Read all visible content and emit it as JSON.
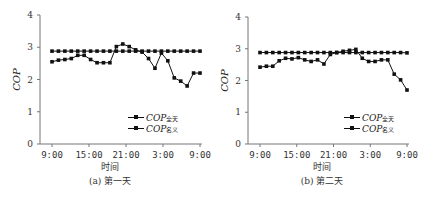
{
  "chart_data": [
    {
      "type": "line",
      "title": "",
      "caption": "(a) 第一天",
      "xlabel": "时间",
      "ylabel": "COP",
      "ylim": [
        0,
        4
      ],
      "yticks": [
        0,
        1,
        2,
        3,
        4
      ],
      "xtick_labels": [
        "9:00",
        "15:00",
        "21:00",
        "3:00",
        "9:00"
      ],
      "x": [
        "9:00",
        "10:00",
        "11:00",
        "12:00",
        "13:00",
        "14:00",
        "15:00",
        "16:00",
        "17:00",
        "18:00",
        "19:00",
        "20:00",
        "21:00",
        "22:00",
        "23:00",
        "0:00",
        "1:00",
        "2:00",
        "3:00",
        "4:00",
        "5:00",
        "6:00",
        "7:00",
        "8:00",
        "9:00"
      ],
      "grid": false,
      "legend_position": "lower right",
      "series": [
        {
          "name": "COP全天",
          "label_main": "COP",
          "label_sub": "全天",
          "values": [
            2.55,
            2.6,
            2.62,
            2.65,
            2.75,
            2.75,
            2.62,
            2.52,
            2.52,
            2.52,
            3.02,
            3.1,
            3.02,
            2.92,
            2.85,
            2.65,
            2.35,
            2.82,
            2.58,
            2.05,
            1.95,
            1.8,
            2.2,
            2.2
          ]
        },
        {
          "name": "COP名义",
          "label_main": "COP",
          "label_sub": "名义",
          "values": [
            2.88,
            2.88,
            2.88,
            2.88,
            2.88,
            2.88,
            2.88,
            2.88,
            2.88,
            2.88,
            2.88,
            2.88,
            2.88,
            2.88,
            2.88,
            2.88,
            2.88,
            2.88,
            2.88,
            2.88,
            2.88,
            2.88,
            2.88,
            2.88
          ]
        }
      ]
    },
    {
      "type": "line",
      "title": "",
      "caption": "(b) 第二天",
      "xlabel": "时间",
      "ylabel": "COP",
      "ylim": [
        0,
        4
      ],
      "yticks": [
        0,
        1,
        2,
        3,
        4
      ],
      "xtick_labels": [
        "9:00",
        "15:00",
        "21:00",
        "3:00",
        "9:00"
      ],
      "x": [
        "9:00",
        "10:00",
        "11:00",
        "12:00",
        "13:00",
        "14:00",
        "15:00",
        "16:00",
        "17:00",
        "18:00",
        "19:00",
        "20:00",
        "21:00",
        "22:00",
        "23:00",
        "0:00",
        "1:00",
        "2:00",
        "3:00",
        "4:00",
        "5:00",
        "6:00",
        "7:00",
        "8:00",
        "9:00"
      ],
      "grid": false,
      "legend_position": "lower right",
      "series": [
        {
          "name": "COP全天",
          "label_main": "COP",
          "label_sub": "全天",
          "values": [
            2.42,
            2.45,
            2.45,
            2.62,
            2.7,
            2.68,
            2.72,
            2.65,
            2.6,
            2.65,
            2.52,
            2.82,
            2.88,
            2.92,
            2.95,
            2.98,
            2.7,
            2.6,
            2.6,
            2.65,
            2.65,
            2.2,
            2.02,
            1.7
          ]
        },
        {
          "name": "COP名义",
          "label_main": "COP",
          "label_sub": "名义",
          "values": [
            2.88,
            2.88,
            2.88,
            2.88,
            2.88,
            2.88,
            2.88,
            2.88,
            2.88,
            2.88,
            2.88,
            2.88,
            2.88,
            2.88,
            2.88,
            2.88,
            2.88,
            2.88,
            2.88,
            2.88,
            2.88,
            2.88,
            2.88,
            2.87
          ]
        }
      ]
    }
  ]
}
